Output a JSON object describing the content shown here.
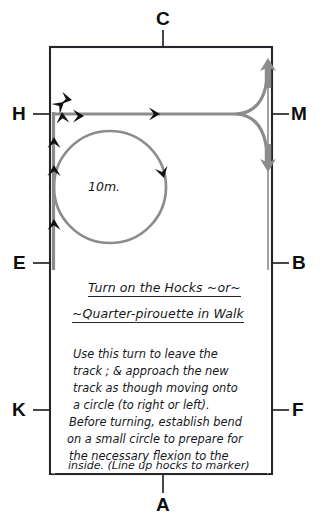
{
  "diagram": {
    "kind": "dressage-arena-figure",
    "title_lines": [
      "Turn on the Hocks ~or~",
      "~Quarter-pirouette in Walk"
    ],
    "body_lines": [
      "Use this turn to leave the",
      "track ; & approach the new",
      "track as though moving onto",
      "a circle (to right or left).",
      "Before turning, establish bend",
      "on a small circle to prepare for",
      "the necessary flexion to the",
      "inside. (Line up hocks to marker)"
    ],
    "circle_label": "10m.",
    "markers": [
      {
        "id": "marker-c",
        "label": "C",
        "side": "top",
        "x": 163,
        "y": 20
      },
      {
        "id": "marker-m",
        "label": "M",
        "side": "right",
        "x": 298,
        "y": 114
      },
      {
        "id": "marker-b",
        "label": "B",
        "side": "right",
        "x": 298,
        "y": 263
      },
      {
        "id": "marker-f",
        "label": "F",
        "side": "right",
        "x": 298,
        "y": 410
      },
      {
        "id": "marker-a",
        "label": "A",
        "side": "bottom",
        "x": 163,
        "y": 503
      },
      {
        "id": "marker-k",
        "label": "K",
        "side": "left",
        "x": 24,
        "y": 410
      },
      {
        "id": "marker-e",
        "label": "E",
        "side": "left",
        "x": 24,
        "y": 263
      },
      {
        "id": "marker-h",
        "label": "H",
        "side": "left",
        "x": 24,
        "y": 114
      }
    ],
    "colors": {
      "arena_line": "#23262b",
      "track_path": "#8c8c8c",
      "arrow_black": "#111111",
      "ink": "#16181c",
      "background": "#ffffff"
    },
    "geometry": {
      "arena": {
        "x": 50,
        "y": 47,
        "width": 222,
        "height": 427
      },
      "circle": {
        "cx": 110,
        "cy": 187,
        "r": 56
      },
      "track_line_y": 114
    }
  }
}
